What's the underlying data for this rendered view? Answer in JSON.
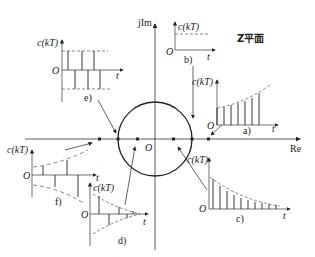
{
  "diagram": {
    "title": "Z平面",
    "axes": {
      "imag_label": "jIm",
      "real_label": "Re",
      "origin_label": "O"
    },
    "unit_circle": true,
    "poles": [
      {
        "id": "e",
        "position": "on circle, z = -1"
      },
      {
        "id": "f",
        "position": "outside circle, negative real"
      },
      {
        "id": "d",
        "position": "inside circle, negative real"
      },
      {
        "id": "c",
        "position": "inside circle, positive real"
      },
      {
        "id": "b",
        "position": "on circle, z = 1"
      },
      {
        "id": "a",
        "position": "outside circle, positive real"
      }
    ],
    "subplots": [
      {
        "id": "a",
        "label": "a)",
        "y_label": "c(kT)",
        "x_label": "t",
        "origin": "O",
        "behavior": "monotonically increasing (divergent)"
      },
      {
        "id": "b",
        "label": "b)",
        "y_label": "c(kT)",
        "x_label": "t",
        "origin": "O",
        "behavior": "constant"
      },
      {
        "id": "c",
        "label": "c)",
        "y_label": "c(kT)",
        "x_label": "t",
        "origin": "O",
        "behavior": "monotonically decaying (convergent)"
      },
      {
        "id": "d",
        "label": "d)",
        "y_label": "c(kT)",
        "x_label": "t",
        "origin": "O",
        "behavior": "alternating decaying oscillation"
      },
      {
        "id": "e",
        "label": "e)",
        "y_label": "c(kT)",
        "x_label": "t",
        "origin": "O",
        "behavior": "alternating constant-amplitude oscillation"
      },
      {
        "id": "f",
        "label": "f)",
        "y_label": "c(kT)",
        "x_label": "t",
        "origin": "O",
        "behavior": "alternating divergent oscillation"
      }
    ]
  }
}
